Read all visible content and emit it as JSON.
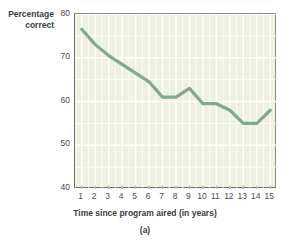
{
  "figure": {
    "caption": "(a)"
  },
  "chart_data": {
    "type": "line",
    "title": "",
    "subtitle": "",
    "xlabel": "Time since program aired (in years)",
    "ylabel": "Percentage correct",
    "ylabel_line1": "Percentage",
    "ylabel_line2": "correct",
    "x": [
      1,
      2,
      3,
      4,
      5,
      6,
      7,
      8,
      9,
      10,
      11,
      12,
      13,
      14,
      15
    ],
    "values": [
      76.5,
      73.0,
      70.5,
      68.5,
      66.5,
      64.5,
      61.0,
      61.0,
      63.0,
      59.5,
      59.5,
      58.0,
      55.0,
      55.0,
      58.0
    ],
    "series": [
      {
        "name": "Percentage correct",
        "values": [
          76.5,
          73.0,
          70.5,
          68.5,
          66.5,
          64.5,
          61.0,
          61.0,
          63.0,
          59.5,
          59.5,
          58.0,
          55.0,
          55.0,
          58.0
        ]
      }
    ],
    "xticks": [
      "1",
      "2",
      "3",
      "4",
      "5",
      "6",
      "7",
      "8",
      "9",
      "10",
      "11",
      "12",
      "13",
      "14",
      "15"
    ],
    "yticks": [
      "80",
      "70",
      "60",
      "50",
      "40"
    ],
    "ytick_values": [
      80,
      70,
      60,
      50,
      40
    ],
    "xlim": [
      0.5,
      15.5
    ],
    "ylim": [
      40,
      80
    ],
    "grid": true,
    "legend": "none",
    "colors": {
      "line": "#7fab8c",
      "plot_background": "#eef0e2",
      "gridline": "#ffffff",
      "axis": "#6b6b63",
      "text": "#3d3d3d"
    }
  }
}
